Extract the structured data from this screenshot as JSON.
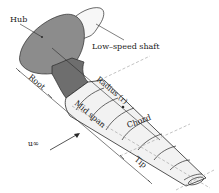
{
  "diagram": {
    "type": "wind-turbine-blade-schematic",
    "labels": {
      "hub": "Hub",
      "shaft": "Low–speed shaft",
      "root": "Root",
      "radius": "Radius (r)",
      "chord": "Chord",
      "mid_span": "Mid span",
      "tip": "Tip",
      "freestream": "u∞"
    },
    "colors": {
      "hub_fill": "#8c8c8c",
      "root_fill": "#6e6e6e",
      "blade_fill": "#f2f2f2",
      "shaft_fill": "#f7f7f7",
      "line": "#2a2a2a",
      "dashed": "#9a9a9a"
    }
  }
}
